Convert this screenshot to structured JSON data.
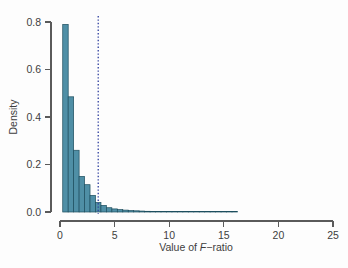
{
  "figure": {
    "background_color": "#fdfdfd",
    "bar_fill_color": "#4f8fa6",
    "bar_border_color": "#1d4e5e",
    "axis_color": "#5a5a5a",
    "critical_line_color": "#2f3f9e"
  },
  "chart_data": {
    "type": "bar",
    "title": "",
    "subtitle": "",
    "xlabel": "Value of F-ratio",
    "xlabel_prefix": "Value of ",
    "xlabel_italic": "F",
    "xlabel_suffix": "−ratio",
    "ylabel": "Density",
    "xlim": [
      0,
      25
    ],
    "ylim": [
      0,
      0.8
    ],
    "grid": false,
    "legend": null,
    "legend_position": "none",
    "xticks": [
      0,
      5,
      10,
      15,
      20,
      25
    ],
    "xtick_labels": [
      "0",
      "5",
      "10",
      "15",
      "20",
      "25"
    ],
    "yticks": [
      0.0,
      0.2,
      0.4,
      0.6,
      0.8
    ],
    "ytick_labels": [
      "0.0",
      "0.2",
      "0.4",
      "0.6",
      "0.8"
    ],
    "bin_width": 0.5,
    "bin_edges": [
      0.25,
      0.75,
      1.25,
      1.75,
      2.25,
      2.75,
      3.25,
      3.75,
      4.25,
      4.75,
      5.25,
      5.75,
      6.25,
      6.75,
      7.25,
      7.75,
      8.25,
      8.75,
      9.25,
      9.75,
      10.25,
      10.75,
      11.25,
      11.75,
      12.25,
      12.75,
      13.25,
      13.75,
      14.25,
      14.75,
      15.25,
      15.75,
      16.25
    ],
    "categories": [
      "0.25-0.75",
      "0.75-1.25",
      "1.25-1.75",
      "1.75-2.25",
      "2.25-2.75",
      "2.75-3.25",
      "3.25-3.75",
      "3.75-4.25",
      "4.25-4.75",
      "4.75-5.25",
      "5.25-5.75",
      "5.75-6.25",
      "6.25-6.75",
      "6.75-7.25",
      "7.25-7.75",
      "7.75-8.25",
      "8.25-8.75",
      "8.75-9.25",
      "9.25-9.75",
      "9.75-10.25",
      "10.25-10.75",
      "10.75-11.25",
      "11.25-11.75",
      "11.75-12.25",
      "12.25-12.75",
      "12.75-13.25",
      "13.25-13.75",
      "13.75-14.25",
      "14.25-14.75",
      "14.75-15.25",
      "15.25-15.75",
      "15.75-16.25"
    ],
    "values": [
      0.79,
      0.485,
      0.26,
      0.15,
      0.115,
      0.07,
      0.04,
      0.028,
      0.018,
      0.013,
      0.01,
      0.008,
      0.006,
      0.005,
      0.004,
      0.003,
      0.0022,
      0.0018,
      0.0015,
      0.0012,
      0.001,
      0.0008,
      0.0007,
      0.0006,
      0.0005,
      0.0004,
      0.0004,
      0.0003,
      0.0003,
      0.0002,
      0.0002,
      0.0002
    ],
    "annotations": [
      {
        "name": "critical-value-line",
        "type": "vline",
        "x": 3.5,
        "style": "dotted",
        "color": "#2f3f9e"
      }
    ]
  }
}
